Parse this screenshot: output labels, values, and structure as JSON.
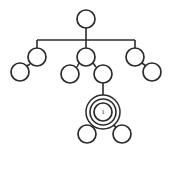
{
  "diagram": {
    "type": "tree",
    "canvas": {
      "width": 173,
      "height": 170,
      "background": "#ffffff"
    },
    "style": {
      "stroke_color": "#2b2b2b",
      "node_fill": "#ffffff",
      "node_radius": 9,
      "edge_width": 1.6
    },
    "selected_node": {
      "id": "n-selected",
      "label": "1",
      "center": {
        "x": 103,
        "y": 112
      },
      "highlight": "concentric-rings",
      "ring_radii": [
        9,
        13,
        17
      ]
    },
    "nodes": [
      {
        "id": "n-root",
        "name": "root-node",
        "label": "",
        "cx": 86,
        "cy": 19,
        "r": 9,
        "level": 0
      },
      {
        "id": "n-b1",
        "name": "branch-left-node",
        "label": "",
        "cx": 37,
        "cy": 57,
        "r": 9,
        "level": 1
      },
      {
        "id": "n-b2",
        "name": "branch-middle-node",
        "label": "",
        "cx": 86,
        "cy": 57,
        "r": 9,
        "level": 1
      },
      {
        "id": "n-b3",
        "name": "branch-right-node",
        "label": "",
        "cx": 135,
        "cy": 57,
        "r": 9,
        "level": 1
      },
      {
        "id": "n-b1-leaf",
        "name": "leaf-far-left",
        "label": "",
        "cx": 20,
        "cy": 72,
        "r": 9,
        "level": 2
      },
      {
        "id": "n-b2-left",
        "name": "leaf-middle-left",
        "label": "",
        "cx": 70,
        "cy": 74,
        "r": 9,
        "level": 2
      },
      {
        "id": "n-b2-right",
        "name": "node-middle-right",
        "label": "",
        "cx": 103,
        "cy": 74,
        "r": 9,
        "level": 2
      },
      {
        "id": "n-b3-leaf",
        "name": "leaf-far-right",
        "label": "",
        "cx": 152,
        "cy": 72,
        "r": 9,
        "level": 2
      },
      {
        "id": "n-selected",
        "name": "selected-node",
        "label": "1",
        "cx": 103,
        "cy": 112,
        "r": 9,
        "level": 3
      },
      {
        "id": "n-sel-left",
        "name": "leaf-selected-left",
        "label": "",
        "cx": 87,
        "cy": 134,
        "r": 9,
        "level": 4
      },
      {
        "id": "n-sel-right",
        "name": "leaf-selected-right",
        "label": "",
        "cx": 122,
        "cy": 134,
        "r": 9,
        "level": 4
      }
    ],
    "edges": [
      {
        "id": "e-root-bus",
        "name": "edge-root-to-bus",
        "from": "n-root",
        "to": "bus",
        "kind": "vertical"
      },
      {
        "id": "e-bus",
        "name": "edge-horizontal-bus",
        "from": "x37",
        "to": "x135",
        "kind": "horizontal"
      },
      {
        "id": "e-bus-b1",
        "name": "edge-bus-to-branch-left",
        "from": "bus",
        "to": "n-b1",
        "kind": "vertical"
      },
      {
        "id": "e-bus-b2",
        "name": "edge-bus-to-branch-middle",
        "from": "bus",
        "to": "n-b2",
        "kind": "vertical"
      },
      {
        "id": "e-bus-b3",
        "name": "edge-bus-to-branch-right",
        "from": "bus",
        "to": "n-b3",
        "kind": "vertical"
      },
      {
        "id": "e-b1-leaf",
        "name": "edge-branch-left-to-leaf",
        "from": "n-b1",
        "to": "n-b1-leaf",
        "kind": "diagonal"
      },
      {
        "id": "e-b2-left",
        "name": "edge-branch-mid-to-left",
        "from": "n-b2",
        "to": "n-b2-left",
        "kind": "diagonal"
      },
      {
        "id": "e-b2-right",
        "name": "edge-branch-mid-to-right",
        "from": "n-b2",
        "to": "n-b2-right",
        "kind": "diagonal"
      },
      {
        "id": "e-b3-leaf",
        "name": "edge-branch-right-to-leaf",
        "from": "n-b3",
        "to": "n-b3-leaf",
        "kind": "diagonal"
      },
      {
        "id": "e-sel",
        "name": "edge-to-selected-node",
        "from": "n-b2-right",
        "to": "n-selected",
        "kind": "vertical"
      },
      {
        "id": "e-sel-left",
        "name": "edge-selected-to-left",
        "from": "n-selected",
        "to": "n-sel-left",
        "kind": "diagonal"
      },
      {
        "id": "e-sel-right",
        "name": "edge-selected-to-right",
        "from": "n-selected",
        "to": "n-sel-right",
        "kind": "diagonal"
      }
    ]
  }
}
